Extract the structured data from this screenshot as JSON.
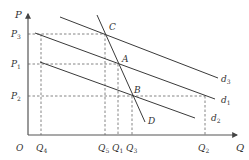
{
  "diagram": {
    "type": "economics-demand-shift",
    "axes": {
      "y_label": "P",
      "x_label": "Q",
      "origin_label": "O"
    },
    "price_levels": [
      {
        "label": "P",
        "sub": "3"
      },
      {
        "label": "P",
        "sub": "1"
      },
      {
        "label": "P",
        "sub": "2"
      }
    ],
    "quantity_levels": [
      {
        "label": "Q",
        "sub": "4"
      },
      {
        "label": "Q",
        "sub": "5"
      },
      {
        "label": "Q",
        "sub": "1"
      },
      {
        "label": "Q",
        "sub": "3"
      },
      {
        "label": "Q",
        "sub": "2"
      }
    ],
    "curves": [
      {
        "label": "d",
        "sub": "3"
      },
      {
        "label": "d",
        "sub": "1"
      },
      {
        "label": "d",
        "sub": "2"
      }
    ],
    "points": {
      "C": "C",
      "A": "A",
      "B": "B",
      "D": "D"
    }
  }
}
